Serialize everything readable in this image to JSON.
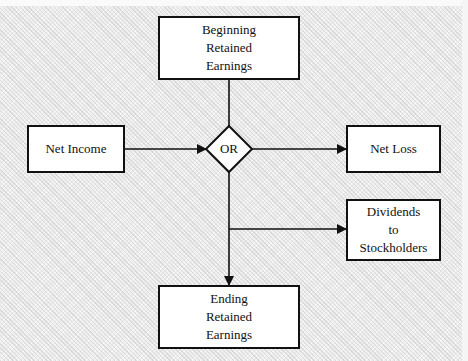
{
  "diagram": {
    "type": "flowchart",
    "nodes": {
      "beginning": {
        "label": "Beginning\nRetained\nEarnings"
      },
      "net_income": {
        "label": "Net Income"
      },
      "decision": {
        "label": "OR"
      },
      "net_loss": {
        "label": "Net Loss"
      },
      "dividends": {
        "label": "Dividends\nto\nStockholders"
      },
      "ending": {
        "label": "Ending\nRetained\nEarnings"
      }
    },
    "edges": [
      {
        "from": "beginning",
        "to": "decision"
      },
      {
        "from": "net_income",
        "to": "decision"
      },
      {
        "from": "decision",
        "to": "net_loss"
      },
      {
        "from": "decision",
        "to": "dividends"
      },
      {
        "from": "decision",
        "to": "ending"
      }
    ],
    "colors": {
      "stroke": "#111111",
      "box_fill": "#ffffff",
      "background": "#ececec"
    }
  }
}
